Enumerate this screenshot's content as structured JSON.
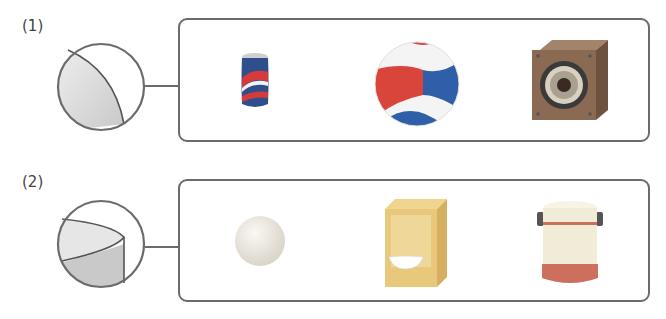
{
  "problems": [
    {
      "label": "(1)",
      "hint_shape": "curved-surface-sphere-segment",
      "objects": [
        {
          "name": "soda-can",
          "colors": {
            "body": "#2e4f8c",
            "stripe": "#d63a3a",
            "highlight": "#f2f2f2"
          }
        },
        {
          "name": "volleyball",
          "colors": {
            "red": "#d9453a",
            "blue": "#2f5fa8",
            "white": "#f4f4f4"
          }
        },
        {
          "name": "speaker",
          "colors": {
            "body": "#8a6a52",
            "cone": "#3a3a3a",
            "ring": "#d9d0c0"
          }
        }
      ]
    },
    {
      "label": "(2)",
      "hint_shape": "cylinder-edge-segment",
      "objects": [
        {
          "name": "sphere",
          "colors": {
            "fill": "#e3ded5"
          }
        },
        {
          "name": "cereal-box",
          "colors": {
            "body": "#e8c87a",
            "side": "#d6b060",
            "bowl": "#ffffff"
          }
        },
        {
          "name": "thermos",
          "colors": {
            "body": "#f0ecd8",
            "band": "#cc6f5c",
            "base": "#cc6f5c",
            "handle": "#555555"
          }
        }
      ]
    }
  ],
  "colors": {
    "stroke": "#6b6b6b",
    "shade_light": "#e6e6e6",
    "shade_dark": "#c9c9c9"
  }
}
